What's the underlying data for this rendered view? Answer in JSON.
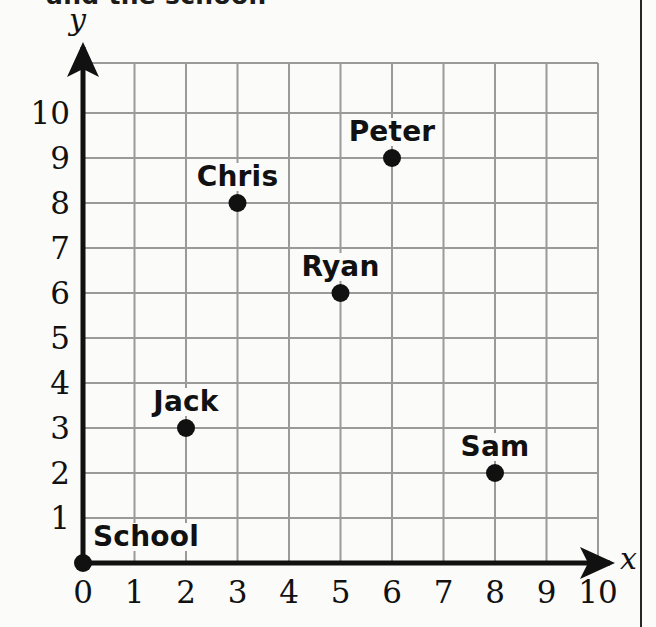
{
  "caption": {
    "text": "and the school."
  },
  "chart_data": {
    "type": "scatter",
    "title": "",
    "xlabel": "x",
    "ylabel": "y",
    "xlim": [
      0,
      10
    ],
    "ylim": [
      0,
      10
    ],
    "grid": true,
    "legend": "none",
    "x_ticks": [
      "0",
      "1",
      "2",
      "3",
      "4",
      "5",
      "6",
      "7",
      "8",
      "9",
      "10"
    ],
    "y_ticks": [
      "0",
      "1",
      "2",
      "3",
      "4",
      "5",
      "6",
      "7",
      "8",
      "9",
      "10"
    ],
    "points": [
      {
        "label": "School",
        "x": 0,
        "y": 0,
        "label_pos": "left"
      },
      {
        "label": "Jack",
        "x": 2,
        "y": 3,
        "label_pos": "center"
      },
      {
        "label": "Chris",
        "x": 3,
        "y": 8,
        "label_pos": "center"
      },
      {
        "label": "Ryan",
        "x": 5,
        "y": 6,
        "label_pos": "center"
      },
      {
        "label": "Peter",
        "x": 6,
        "y": 9,
        "label_pos": "center"
      },
      {
        "label": "Sam",
        "x": 8,
        "y": 2,
        "label_pos": "center"
      }
    ],
    "marker": {
      "shape": "filled-circle",
      "color": "#111111",
      "radius": 9
    }
  },
  "style": {
    "background": "#fbfbf9",
    "grid_color": "#9a9a9a",
    "axis_color": "#111111",
    "text_color": "#111111",
    "page_rule_color": "#262626"
  },
  "geometry": {
    "origin_x": 83,
    "origin_y": 563,
    "unit_x": 51.5,
    "unit_y": 45,
    "grid_top": 63,
    "grid_right": 598
  }
}
